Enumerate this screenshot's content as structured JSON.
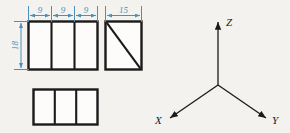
{
  "drawing": {
    "title": "Orthographic multiview projection with coordinate axes",
    "background_color": "#f4f2ee",
    "line_color": "#1a1a1a",
    "dimension_color": "#4a90b8"
  },
  "dimensions": {
    "width_segments": [
      {
        "label": "9"
      },
      {
        "label": "9"
      },
      {
        "label": "9"
      }
    ],
    "height": {
      "label": "18"
    },
    "depth": {
      "label": "15"
    }
  },
  "views": {
    "front": {
      "name": "front-view",
      "cells": 3,
      "width_label": "9",
      "height_label": "18"
    },
    "side": {
      "name": "side-view",
      "has_diagonal": true,
      "width_label": "15"
    },
    "top": {
      "name": "top-view",
      "cells": 3
    }
  },
  "axes": {
    "x": {
      "label": "X"
    },
    "y": {
      "label": "Y"
    },
    "z": {
      "label": "Z"
    }
  }
}
